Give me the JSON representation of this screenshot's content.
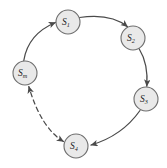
{
  "figure": {
    "type": "cycle-diagram",
    "background_color": "#ffffff",
    "node_fill": "#e9e9e9",
    "node_stroke": "#6e6e6e",
    "edge_color": "#4a4a4a",
    "label_color": "#1c1c1c"
  },
  "nodes": [
    {
      "id": "s1",
      "base": "S",
      "sub": "1",
      "cx": 68,
      "cy": 22,
      "r": 12
    },
    {
      "id": "s2",
      "base": "S",
      "sub": "2",
      "cx": 133,
      "cy": 38,
      "r": 12
    },
    {
      "id": "s3",
      "base": "S",
      "sub": "3",
      "cx": 146,
      "cy": 99,
      "r": 12
    },
    {
      "id": "s4",
      "base": "S",
      "sub": "4",
      "cx": 76,
      "cy": 146,
      "r": 12
    },
    {
      "id": "sm",
      "base": "S",
      "sub": "m",
      "cx": 25,
      "cy": 73,
      "r": 12
    }
  ],
  "edges": [
    {
      "id": "e-s1-s2",
      "from": "s1",
      "to": "s2",
      "style": "solid",
      "arrow": "single"
    },
    {
      "id": "e-s2-s3",
      "from": "s2",
      "to": "s3",
      "style": "solid",
      "arrow": "single"
    },
    {
      "id": "e-s3-s4",
      "from": "s3",
      "to": "s4",
      "style": "solid",
      "arrow": "single"
    },
    {
      "id": "e-s4-sm",
      "from": "s4",
      "to": "sm",
      "style": "dashed",
      "arrow": "double"
    },
    {
      "id": "e-sm-s1",
      "from": "sm",
      "to": "s1",
      "style": "solid",
      "arrow": "single"
    }
  ],
  "labels": {
    "s1": {
      "base": "S",
      "sub": "1"
    },
    "s2": {
      "base": "S",
      "sub": "2"
    },
    "s3": {
      "base": "S",
      "sub": "3"
    },
    "s4": {
      "base": "S",
      "sub": "4"
    },
    "sm": {
      "base": "S",
      "sub": "m"
    }
  }
}
